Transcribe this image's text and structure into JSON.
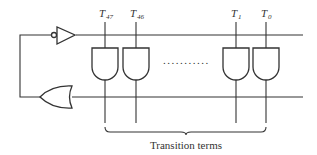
{
  "diagram": {
    "caption": "Transition terms",
    "ellipsis": "...........",
    "and_gates": [
      {
        "label": "T",
        "subscript": "47",
        "x": 105
      },
      {
        "label": "T",
        "subscript": "46",
        "x": 136
      },
      {
        "label": "T",
        "subscript": "1",
        "x": 236
      },
      {
        "label": "T",
        "subscript": "0",
        "x": 266
      }
    ],
    "components": {
      "inverter": "inverter-with-input-bubble",
      "or_gate": "or-gate",
      "and_gate": "and-gate"
    },
    "colors": {
      "line": "#333333",
      "background": "#ffffff"
    }
  }
}
